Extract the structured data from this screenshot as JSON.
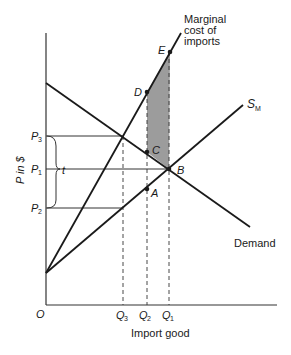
{
  "diagram": {
    "axes": {
      "ylabel": "P in $",
      "xlabel": "Import good",
      "origin_label": "O"
    },
    "curves": {
      "marginal_cost": {
        "label_lines": [
          "Marginal",
          "cost of",
          "imports"
        ]
      },
      "supply": {
        "label_main": "S",
        "label_sub": "M"
      },
      "demand": {
        "label": "Demand"
      }
    },
    "points": {
      "A": "A",
      "B": "B",
      "C": "C",
      "D": "D",
      "E": "E"
    },
    "price_levels": {
      "P3": {
        "main": "P",
        "sub": "3"
      },
      "P1": {
        "main": "P",
        "sub": "1"
      },
      "P2": {
        "main": "P",
        "sub": "2"
      }
    },
    "quantities": {
      "Q3": {
        "main": "Q",
        "sub": "3"
      },
      "Q2": {
        "main": "Q",
        "sub": "2"
      },
      "Q1": {
        "main": "Q",
        "sub": "1"
      }
    },
    "tariff_label": "t",
    "colors": {
      "line": "#1a1a1a",
      "axis": "#333333",
      "shade": "#9c9c9c"
    }
  }
}
